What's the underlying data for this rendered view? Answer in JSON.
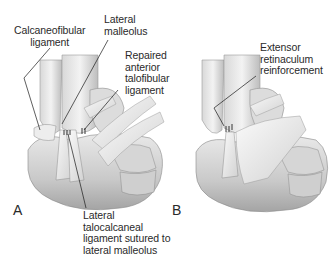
{
  "figure": {
    "panels": [
      {
        "id": "A",
        "letter": "A",
        "labels": {
          "calcaneofibular": "Calcaneofibular\nligament",
          "lateral_malleolus": "Lateral\nmalleolus",
          "repaired_atfl": "Repaired\nanterior\ntalofibular\nligament",
          "talocalcaneal": "Lateral\ntalocalcaneal\nligament sutured to\nlateral malleolus"
        }
      },
      {
        "id": "B",
        "letter": "B",
        "labels": {
          "extensor_retinaculum": "Extensor\nretinaculum\nreinforcement"
        }
      }
    ],
    "colors": {
      "background": "#ffffff",
      "text": "#2a2a2a",
      "bone_light": "#e6e6e6",
      "bone_mid": "#c4c4c4",
      "bone_shadow": "#8c8c8c",
      "ligament": "#f2f2f2",
      "leader_line": "#1a1a1a"
    }
  }
}
